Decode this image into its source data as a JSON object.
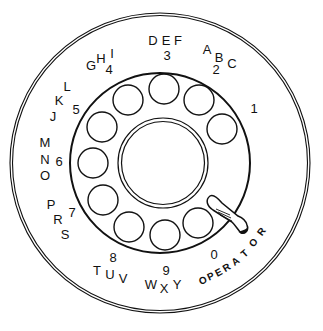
{
  "figure": {
    "colors": {
      "ink": "#111111",
      "paper": "#ffffff"
    },
    "outer_ring": {
      "cx": 160,
      "cy": 163,
      "r_outer": 150,
      "r_inner": 147.5
    },
    "plate_ring": {
      "cx": 160,
      "cy": 163,
      "r": 90
    },
    "center_ring": {
      "cx": 163,
      "cy": 163,
      "r_outer": 45,
      "r_inner": 41.5
    },
    "finger_holes": [
      {
        "digit": "1",
        "cx": 222,
        "cy": 129,
        "r": 15
      },
      {
        "digit": "2",
        "cx": 199,
        "cy": 100,
        "r": 15
      },
      {
        "digit": "3",
        "cx": 164,
        "cy": 89,
        "r": 15
      },
      {
        "digit": "4",
        "cx": 128,
        "cy": 100,
        "r": 15
      },
      {
        "digit": "5",
        "cx": 102,
        "cy": 127,
        "r": 15
      },
      {
        "digit": "6",
        "cx": 93,
        "cy": 163,
        "r": 15
      },
      {
        "digit": "7",
        "cx": 103,
        "cy": 200,
        "r": 15
      },
      {
        "digit": "8",
        "cx": 129,
        "cy": 227,
        "r": 15
      },
      {
        "digit": "9",
        "cx": 165,
        "cy": 235,
        "r": 15
      },
      {
        "digit": "0",
        "cx": 198,
        "cy": 223,
        "r": 15
      }
    ],
    "labels": [
      {
        "digit": "1",
        "digit_pos": [
          254,
          110
        ],
        "letters": []
      },
      {
        "digit": "2",
        "digit_pos": [
          216,
          71
        ],
        "letters": [
          {
            "ch": "A",
            "x": 207,
            "y": 51
          },
          {
            "ch": "B",
            "x": 219,
            "y": 59
          },
          {
            "ch": "C",
            "x": 232,
            "y": 65
          }
        ]
      },
      {
        "digit": "3",
        "digit_pos": [
          167,
          57
        ],
        "letters": [
          {
            "ch": "D",
            "x": 153,
            "y": 42
          },
          {
            "ch": "E",
            "x": 166,
            "y": 42
          },
          {
            "ch": "F",
            "x": 178,
            "y": 42
          }
        ]
      },
      {
        "digit": "4",
        "digit_pos": [
          109,
          71
        ],
        "letters": [
          {
            "ch": "G",
            "x": 91,
            "y": 67
          },
          {
            "ch": "H",
            "x": 101,
            "y": 60
          },
          {
            "ch": "I",
            "x": 112,
            "y": 55
          }
        ]
      },
      {
        "digit": "5",
        "digit_pos": [
          76,
          111
        ],
        "letters": [
          {
            "ch": "J",
            "x": 53,
            "y": 118
          },
          {
            "ch": "K",
            "x": 59,
            "y": 102
          },
          {
            "ch": "L",
            "x": 67,
            "y": 88
          }
        ]
      },
      {
        "digit": "6",
        "digit_pos": [
          59,
          163
        ],
        "letters": [
          {
            "ch": "M",
            "x": 45,
            "y": 144
          },
          {
            "ch": "N",
            "x": 45,
            "y": 161
          },
          {
            "ch": "O",
            "x": 45,
            "y": 177
          }
        ]
      },
      {
        "digit": "7",
        "digit_pos": [
          72,
          214
        ],
        "letters": [
          {
            "ch": "P",
            "x": 51,
            "y": 206
          },
          {
            "ch": "R",
            "x": 58,
            "y": 221
          },
          {
            "ch": "S",
            "x": 65,
            "y": 236
          }
        ]
      },
      {
        "digit": "8",
        "digit_pos": [
          113,
          259
        ],
        "letters": [
          {
            "ch": "T",
            "x": 97,
            "y": 272
          },
          {
            "ch": "U",
            "x": 110,
            "y": 276
          },
          {
            "ch": "V",
            "x": 123,
            "y": 280
          }
        ]
      },
      {
        "digit": "9",
        "digit_pos": [
          166,
          272
        ],
        "letters": [
          {
            "ch": "W",
            "x": 151,
            "y": 286
          },
          {
            "ch": "X",
            "x": 164,
            "y": 290
          },
          {
            "ch": "Y",
            "x": 177,
            "y": 286
          }
        ]
      },
      {
        "digit": "0",
        "digit_pos": [
          214,
          256
        ],
        "letters": []
      }
    ],
    "operator": {
      "text": "OPERATOR",
      "letters": [
        {
          "ch": "O",
          "x": 203,
          "y": 281,
          "rot": -22
        },
        {
          "ch": "P",
          "x": 211,
          "y": 277,
          "rot": -24
        },
        {
          "ch": "E",
          "x": 219,
          "y": 273,
          "rot": -28
        },
        {
          "ch": "R",
          "x": 227,
          "y": 268,
          "rot": -32
        },
        {
          "ch": "A",
          "x": 236,
          "y": 262,
          "rot": -36
        },
        {
          "ch": "T",
          "x": 245,
          "y": 254,
          "rot": -42
        },
        {
          "ch": "O",
          "x": 254,
          "y": 243,
          "rot": -48
        },
        {
          "ch": "R",
          "x": 262,
          "y": 232,
          "rot": -54
        }
      ]
    },
    "finger_stop": {
      "name": "finger stop",
      "path": "M 210 196 C 205 200, 207 206, 213 210 L 232 222 C 236 226, 238 230, 241 233 C 246 234, 249 230, 247 225 C 246 221, 243 218, 238 216 L 222 203 C 217 197, 213 194, 210 196 Z",
      "hatches": [
        "M 216 209 L 230 215",
        "M 218 212 L 231 218",
        "M 220 215 L 232 221"
      ],
      "tip": "M 240 232 C 243 234, 246 233, 247 229 C 245 231, 242 231, 240 232 Z"
    }
  }
}
